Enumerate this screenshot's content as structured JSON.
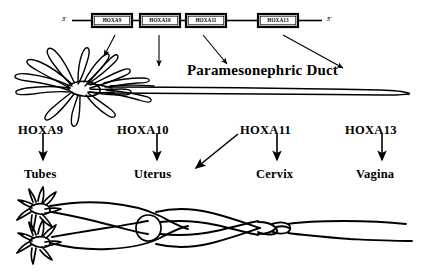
{
  "figure": {
    "background_color": "#ffffff",
    "ink_color": "#000000",
    "width": 427,
    "height": 274
  },
  "gene_cluster": {
    "left_end_label": "3'",
    "right_end_label": "5'",
    "boxes": [
      {
        "label": "HOXA9",
        "x": 92,
        "y": 14,
        "w": 40,
        "h": 13
      },
      {
        "label": "HOXA10",
        "x": 140,
        "y": 14,
        "w": 40,
        "h": 13
      },
      {
        "label": "HOXA11",
        "x": 186,
        "y": 14,
        "w": 40,
        "h": 13
      },
      {
        "label": "HOXA13",
        "x": 258,
        "y": 14,
        "w": 40,
        "h": 13
      }
    ]
  },
  "duct": {
    "title": "Paramesonephric Duct"
  },
  "gene_labels": [
    {
      "label": "HOXA9",
      "x": 18,
      "y": 124
    },
    {
      "label": "HOXA10",
      "x": 117,
      "y": 124
    },
    {
      "label": "HOXA11",
      "x": 240,
      "y": 124
    },
    {
      "label": "HOXA13",
      "x": 345,
      "y": 124
    }
  ],
  "organ_labels": [
    {
      "label": "Tubes",
      "x": 24,
      "y": 168
    },
    {
      "label": "Uterus",
      "x": 134,
      "y": 168
    },
    {
      "label": "Cervix",
      "x": 256,
      "y": 168
    },
    {
      "label": "Vagina",
      "x": 356,
      "y": 168
    }
  ],
  "mapping": [
    {
      "gene": "HOXA9",
      "organ": "Tubes"
    },
    {
      "gene": "HOXA10",
      "organ": "Uterus"
    },
    {
      "gene": "HOXA11",
      "organ": "Uterus"
    },
    {
      "gene": "HOXA11",
      "organ": "Cervix"
    },
    {
      "gene": "HOXA13",
      "organ": "Vagina"
    }
  ],
  "anatomy": {
    "upper_caption": "Paramesonephric Duct with fimbriated end",
    "lower_caption": "Female reproductive tract: fallopian tubes, uterus, cervix, vagina"
  }
}
